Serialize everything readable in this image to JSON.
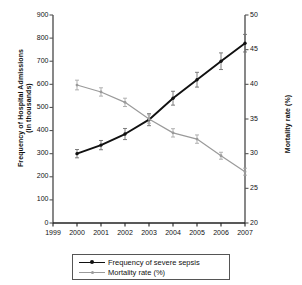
{
  "chart_data": {
    "type": "line",
    "title": "",
    "xlabel": "",
    "x": [
      1999,
      2000,
      2001,
      2002,
      2003,
      2004,
      2005,
      2006,
      2007
    ],
    "x_tick_labels": [
      "1999",
      "2000",
      "2001",
      "2002",
      "2003",
      "2004",
      "2005",
      "2006",
      "2007"
    ],
    "xlim": [
      1999,
      2007
    ],
    "grid": false,
    "legend_position": "bottom",
    "axes": {
      "left": {
        "label_line1": "Frequency of Hospital Admissions",
        "label_line2": "(in thousands)",
        "ylim": [
          0,
          900
        ],
        "ticks": [
          0,
          100,
          200,
          300,
          400,
          500,
          600,
          700,
          800,
          900
        ],
        "tick_labels": [
          "0",
          "100",
          "200",
          "300",
          "400",
          "500",
          "600",
          "700",
          "800",
          "900"
        ]
      },
      "right": {
        "label": "Mortality rate (%)",
        "ylim": [
          20,
          50
        ],
        "ticks": [
          20,
          25,
          30,
          35,
          40,
          45,
          50
        ],
        "tick_labels": [
          "20",
          "25",
          "30",
          "35",
          "40",
          "45",
          "50"
        ]
      }
    },
    "series": [
      {
        "name": "Frequency of severe sepsis",
        "axis": "left",
        "color": "#111111",
        "x": [
          2000,
          2001,
          2002,
          2003,
          2004,
          2005,
          2006,
          2007
        ],
        "values": [
          300,
          337,
          385,
          447,
          540,
          620,
          700,
          778
        ],
        "errors": [
          18,
          20,
          24,
          26,
          30,
          32,
          36,
          38
        ]
      },
      {
        "name": "Mortality rate (%)",
        "axis": "right",
        "color": "#9a9a9a",
        "x": [
          2000,
          2001,
          2002,
          2003,
          2004,
          2005,
          2006,
          2007
        ],
        "values": [
          39.9,
          38.9,
          37.4,
          35.0,
          33.0,
          32.1,
          29.7,
          27.4
        ],
        "errors": [
          0.7,
          0.6,
          0.6,
          0.6,
          0.6,
          0.6,
          0.5,
          0.5
        ]
      }
    ]
  },
  "legend": {
    "items": [
      {
        "label": "Frequency of severe sepsis",
        "color": "#111111"
      },
      {
        "label": "Mortality rate (%)",
        "color": "#9a9a9a"
      }
    ]
  }
}
